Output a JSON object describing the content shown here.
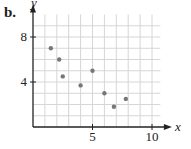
{
  "panel_label": "b.",
  "chart_data": {
    "type": "scatter",
    "title": "",
    "xlabel": "x",
    "ylabel": "y",
    "xlim": [
      0,
      11
    ],
    "ylim": [
      0,
      10
    ],
    "x_ticks": [
      5,
      10
    ],
    "y_ticks": [
      4,
      8
    ],
    "grid": true,
    "points": [
      {
        "x": 1.5,
        "y": 7.0
      },
      {
        "x": 2.2,
        "y": 6.0
      },
      {
        "x": 2.5,
        "y": 4.5
      },
      {
        "x": 4.0,
        "y": 3.7
      },
      {
        "x": 5.0,
        "y": 5.0
      },
      {
        "x": 6.0,
        "y": 3.0
      },
      {
        "x": 6.8,
        "y": 1.8
      },
      {
        "x": 7.8,
        "y": 2.5
      }
    ],
    "colors": {
      "points": "#777777",
      "grid": "#d6d6d6",
      "axis": "#222222"
    }
  }
}
